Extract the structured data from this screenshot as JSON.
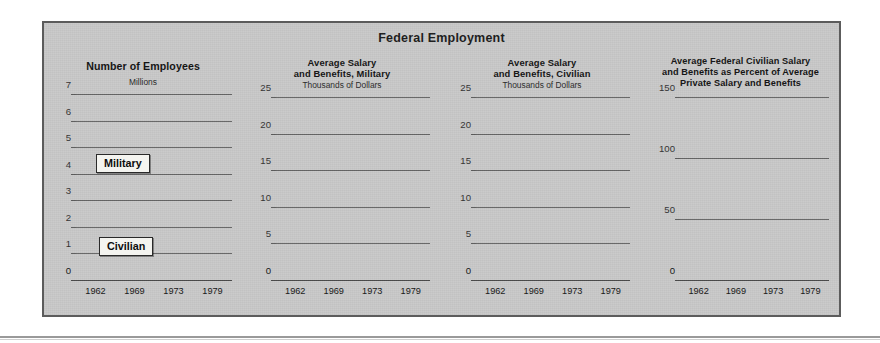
{
  "figure": {
    "title": "Federal Employment",
    "background_color": "#c9c9c9",
    "border_color": "#5c5c5c",
    "bar_color_dark": "#171717",
    "bar_color_gray": "#6d6d6d"
  },
  "legend": {
    "military_label": "Military",
    "civilian_label": "Civilian"
  },
  "chart_data": [
    {
      "id": "number-of-employees",
      "type": "bar",
      "stacked": true,
      "title": "Number of Employees",
      "subtitle": "Millions",
      "xlabel": "",
      "ylabel": "Millions",
      "categories": [
        "1962",
        "1969",
        "1973",
        "1979"
      ],
      "yticks": [
        0,
        1,
        2,
        3,
        4,
        5,
        6,
        7
      ],
      "ylim": [
        0,
        7
      ],
      "grid": true,
      "legend_position": "inline-callout",
      "series": [
        {
          "name": "Civilian",
          "color": "#171717",
          "values": [
            2.45,
            2.8,
            2.65,
            2.8
          ]
        },
        {
          "name": "Military",
          "color": "#6d6d6d",
          "values": [
            2.75,
            3.6,
            2.35,
            2.0
          ]
        }
      ],
      "totals": [
        5.2,
        6.4,
        5.0,
        4.8
      ]
    },
    {
      "id": "avg-salary-military",
      "type": "bar",
      "stacked": false,
      "title": "Average Salary\nand Benefits, Military",
      "title_lines": [
        "Average Salary",
        "and Benefits, Military"
      ],
      "subtitle": "Thousands of Dollars",
      "xlabel": "",
      "ylabel": "Thousands of Dollars",
      "categories": [
        "1962",
        "1969",
        "1973",
        "1979"
      ],
      "yticks": [
        0,
        5,
        10,
        15,
        20,
        25
      ],
      "ylim": [
        0,
        25
      ],
      "grid": true,
      "series": [
        {
          "name": "Average Salary and Benefits, Military",
          "color": "#6d6d6d",
          "values": [
            4.1,
            6.0,
            9.4,
            13.3
          ]
        }
      ]
    },
    {
      "id": "avg-salary-civilian",
      "type": "bar",
      "stacked": false,
      "title": "Average Salary\nand Benefits, Civilian",
      "title_lines": [
        "Average Salary",
        "and Benefits, Civilian"
      ],
      "subtitle": "Thousands of Dollars",
      "xlabel": "",
      "ylabel": "Thousands of Dollars",
      "categories": [
        "1962",
        "1969",
        "1973",
        "1979"
      ],
      "yticks": [
        0,
        5,
        10,
        15,
        20,
        25
      ],
      "ylim": [
        0,
        25
      ],
      "grid": true,
      "series": [
        {
          "name": "Average Salary and Benefits, Civilian",
          "color": "#171717",
          "values": [
            6.8,
            9.4,
            14.5,
            23.0
          ]
        }
      ]
    },
    {
      "id": "federal-vs-private-percent",
      "type": "bar",
      "stacked": false,
      "title": "Average Federal Civilian Salary and Benefits as Percent of Average Private Salary and Benefits",
      "title_lines": [
        "Average Federal Civilian Salary",
        "and Benefits as Percent of Average",
        "Private Salary and Benefits"
      ],
      "subtitle": "",
      "xlabel": "",
      "ylabel": "Percent",
      "categories": [
        "1962",
        "1969",
        "1973",
        "1979"
      ],
      "yticks": [
        0,
        50,
        100,
        150
      ],
      "ylim": [
        0,
        150
      ],
      "grid": true,
      "series": [
        {
          "name": "Federal as percent of private",
          "color": "#171717",
          "values": [
            122,
            128,
            138,
            134
          ]
        }
      ]
    }
  ]
}
